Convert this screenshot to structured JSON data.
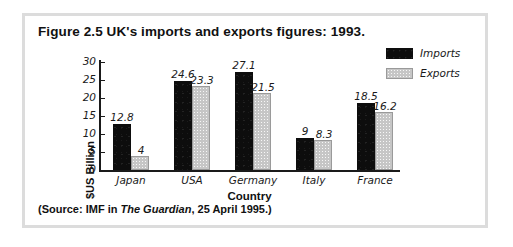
{
  "figure": {
    "title": "Figure 2.5  UK's imports and exports figures: 1993.",
    "source_prefix": "(Source: IMF in ",
    "source_italic": "The Guardian",
    "source_suffix": ", 25 April 1995.)"
  },
  "legend": {
    "position": "top-right",
    "entries": [
      {
        "label": "Imports",
        "color": "#0d0d0d"
      },
      {
        "label": "Exports",
        "color": "#c6c6c6"
      }
    ]
  },
  "chart_data": {
    "type": "bar",
    "title": "Figure 2.5  UK's imports and exports figures: 1993.",
    "xlabel": "Country",
    "ylabel": "$US Billion",
    "categories": [
      "Japan",
      "USA",
      "Germany",
      "Italy",
      "France"
    ],
    "series": [
      {
        "name": "Imports",
        "color": "#0d0d0d",
        "values": [
          12.8,
          24.6,
          27.1,
          9,
          18.5
        ],
        "value_labels": [
          "12.8",
          "24.6",
          "27.1",
          "9",
          "18.5"
        ]
      },
      {
        "name": "Exports",
        "color": "#c6c6c6",
        "values": [
          4,
          23.3,
          21.5,
          8.3,
          16.2
        ],
        "value_labels": [
          "4",
          "23.3",
          "21.5",
          "8.3",
          "16.2"
        ]
      }
    ],
    "ylim": [
      0,
      30
    ],
    "yticks": [
      30,
      25,
      20,
      15,
      10,
      5,
      0
    ],
    "ytick_labels": [
      "30",
      "25",
      "20",
      "15",
      "10",
      "5",
      "0"
    ],
    "grid": false,
    "legend_position": "top-right",
    "data_labels_shown": true
  }
}
